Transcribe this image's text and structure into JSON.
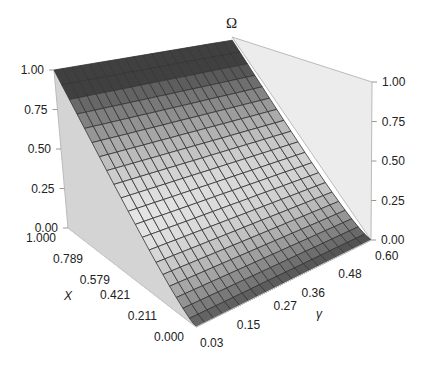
{
  "chart_data": {
    "type": "surface3d",
    "title": "",
    "zlabel": "Ω",
    "xlabel": "X",
    "ylabel": "γ",
    "x_ticks": [
      "0.000",
      "0.211",
      "0.421",
      "0.579",
      "0.789",
      "1.000"
    ],
    "y_ticks": [
      "0.03",
      "0.15",
      "0.27",
      "0.36",
      "0.48",
      "0.60"
    ],
    "z_ticks_left": [
      "0.00",
      "0.25",
      "0.50",
      "0.75",
      "1.00"
    ],
    "z_ticks_right": [
      "0.00",
      "0.25",
      "0.50",
      "0.75",
      "1.00"
    ],
    "xlim": [
      0,
      1
    ],
    "ylim": [
      0.03,
      0.6
    ],
    "zlim": [
      0,
      1
    ],
    "grid_x": 20,
    "grid_y": 20,
    "samples": [
      {
        "X": 0.0,
        "omega": 0.0
      },
      {
        "X": 0.211,
        "omega": 0.15
      },
      {
        "X": 0.421,
        "omega": 0.35
      },
      {
        "X": 0.579,
        "omega": 0.52
      },
      {
        "X": 0.789,
        "omega": 0.76
      },
      {
        "X": 1.0,
        "omega": 1.0
      }
    ]
  }
}
